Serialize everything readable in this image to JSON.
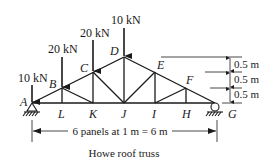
{
  "title": "Howe roof truss",
  "span_label": "6 panels at 1 m = 6 m",
  "nodes": {
    "A": "A",
    "B": "B",
    "C": "C",
    "D": "D",
    "E": "E",
    "F": "F",
    "G": "G",
    "H": "H",
    "I": "I",
    "J": "J",
    "K": "K",
    "L": "L"
  },
  "loads": [
    {
      "node": "A",
      "label": "10 kN"
    },
    {
      "node": "B",
      "label": "20 kN"
    },
    {
      "node": "C",
      "label": "20 kN"
    },
    {
      "node": "D",
      "label": "10 kN"
    }
  ],
  "heights": [
    {
      "label": "0.5 m"
    },
    {
      "label": "0.5 m"
    },
    {
      "label": "0.5 m"
    }
  ],
  "supports": {
    "A": "pin",
    "G": "roller"
  },
  "colors": {
    "line": "#1a1a1a",
    "background": "#ffffff"
  }
}
